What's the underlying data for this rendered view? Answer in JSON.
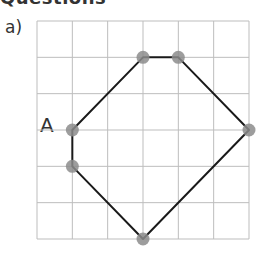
{
  "heading": {
    "text": "Questions",
    "clipped": true
  },
  "question": {
    "part_label": "a)",
    "point_label": "A"
  },
  "grid": {
    "columns": 6,
    "rows": 6,
    "line_color": "#bdbdbd"
  },
  "shape": {
    "type": "hexagon",
    "stroke_color": "#1a1a1a",
    "vertex_color": "#8c8c8c",
    "vertices": [
      {
        "name": "A",
        "col": 1,
        "row": 3
      },
      {
        "name": "",
        "col": 3,
        "row": 1
      },
      {
        "name": "",
        "col": 4,
        "row": 1
      },
      {
        "name": "",
        "col": 6,
        "row": 3
      },
      {
        "name": "",
        "col": 3,
        "row": 6
      },
      {
        "name": "",
        "col": 1,
        "row": 4
      }
    ]
  }
}
